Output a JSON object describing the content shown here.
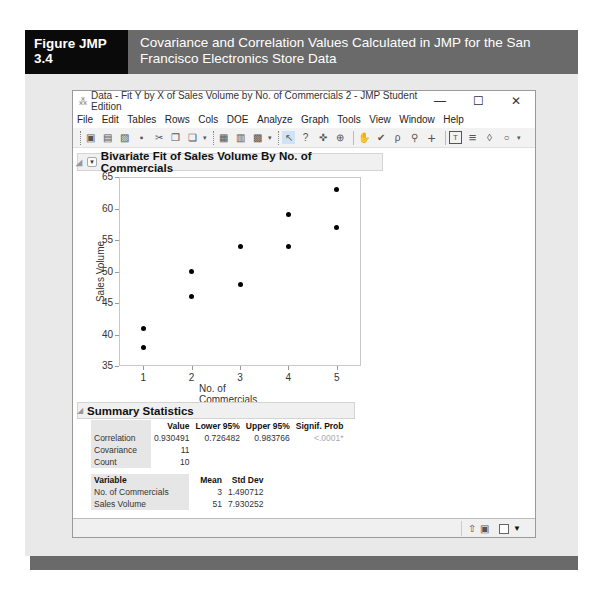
{
  "figure": {
    "label": "Figure JMP 3.4",
    "title": "Covariance and Correlation Values Calculated in JMP for the San Francisco Electronics Store Data"
  },
  "window": {
    "title": "Data - Fit Y by X of Sales Volume by No. of Commercials 2 - JMP Student Edition",
    "controls": {
      "minimize": "—",
      "maximize": "☐",
      "close": "✕"
    },
    "menu": [
      "File",
      "Edit",
      "Tables",
      "Rows",
      "Cols",
      "DOE",
      "Analyze",
      "Graph",
      "Tools",
      "View",
      "Window",
      "Help"
    ]
  },
  "toolbar": {
    "icons": [
      "new-data-table-icon",
      "new-script-icon",
      "open-icon",
      "save-icon",
      "cut-icon",
      "copy-icon",
      "paste-icon",
      "data-table-icon",
      "distribution-icon",
      "fit-model-icon",
      "arrow-tool-icon",
      "help-tool-icon",
      "selection-tool-icon",
      "crosshair-tool-icon",
      "hand-tool-icon",
      "brush-tool-icon",
      "lasso-tool-icon",
      "magnifier-tool-icon",
      "plus-tool-icon",
      "annotate-tool-icon",
      "line-tool-icon",
      "polygon-tool-icon",
      "ellipse-tool-icon"
    ],
    "glyphs": [
      "▣",
      "▤",
      "▨",
      "▪",
      "✂",
      "❐",
      "❏",
      "▦",
      "▥",
      "▩",
      "↖",
      "?",
      "✜",
      "⊕",
      "✋",
      "✔",
      "ρ",
      "🔍",
      "+",
      "T",
      "≡",
      "◊",
      "○"
    ]
  },
  "report": {
    "title": "Bivariate Fit of Sales Volume By No. of Commercials"
  },
  "chart_data": {
    "type": "scatter",
    "title": "Bivariate Fit of Sales Volume By No. of Commercials",
    "xlabel": "No. of Commercials",
    "ylabel": "Sales Volume",
    "xlim": [
      0.5,
      5.5
    ],
    "ylim": [
      35,
      65
    ],
    "xticks": [
      "1",
      "2",
      "3",
      "4",
      "5"
    ],
    "yticks": [
      "35",
      "40",
      "45",
      "50",
      "55",
      "60",
      "65"
    ],
    "grid": false,
    "points": [
      {
        "x": 1,
        "y": 41
      },
      {
        "x": 1,
        "y": 38
      },
      {
        "x": 2,
        "y": 50
      },
      {
        "x": 2,
        "y": 46
      },
      {
        "x": 3,
        "y": 54
      },
      {
        "x": 3,
        "y": 48
      },
      {
        "x": 4,
        "y": 59
      },
      {
        "x": 4,
        "y": 54
      },
      {
        "x": 5,
        "y": 63
      },
      {
        "x": 5,
        "y": 57
      }
    ]
  },
  "summary": {
    "title": "Summary Statistics",
    "columns": [
      "",
      "Value",
      "Lower 95%",
      "Upper 95%",
      "Signif. Prob"
    ],
    "rows": [
      {
        "label": "Correlation",
        "value": "0.930491",
        "lower": "0.726482",
        "upper": "0.983766",
        "prob": "<.0001*"
      },
      {
        "label": "Covariance",
        "value": "11"
      },
      {
        "label": "Count",
        "value": "10"
      }
    ],
    "var_columns": [
      "Variable",
      "Mean",
      "Std Dev"
    ],
    "var_rows": [
      {
        "label": "No. of Commercials",
        "mean": "3",
        "sd": "1.490712"
      },
      {
        "label": "Sales Volume",
        "mean": "51",
        "sd": "7.930252"
      }
    ]
  },
  "statusbar": {
    "icons": [
      "navigate-up-icon",
      "layout-icon",
      "checkbox-icon",
      "dropdown-arrow-icon"
    ]
  }
}
